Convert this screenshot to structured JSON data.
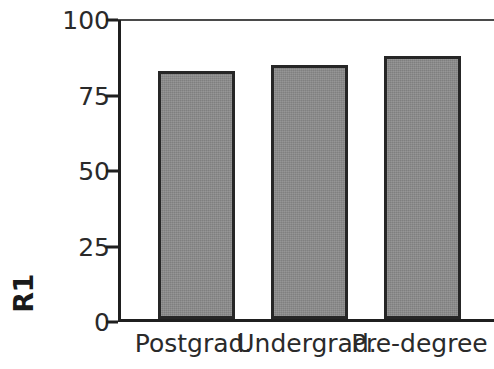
{
  "chart_data": {
    "type": "bar",
    "title": "",
    "subtitle": "",
    "xlabel": "",
    "ylabel": "R1",
    "categories": [
      "Postgrad.",
      "Undergrad.",
      "Pre-degree"
    ],
    "values": [
      82,
      84,
      87
    ],
    "series": [
      {
        "name": "R1",
        "values": [
          82,
          84,
          87
        ]
      }
    ],
    "ylim": [
      0,
      100
    ],
    "yticks": [
      0,
      25,
      50,
      75,
      100
    ],
    "ytick_labels": [
      "0",
      "25",
      "50",
      "75",
      "100"
    ],
    "grid": false,
    "legend": false,
    "legend_position": "none",
    "bar_fill_color": "#8a8a8a",
    "bar_edge_color": "#262626",
    "axis_color": "#1f1f1f",
    "text_color": "#2a2a2a",
    "background_color": "#ffffff"
  },
  "axes": {
    "y_title": "R1",
    "ticks": [
      {
        "label": "100",
        "value": 100
      },
      {
        "label": "75",
        "value": 75
      },
      {
        "label": "50",
        "value": 50
      },
      {
        "label": "25",
        "value": 25
      },
      {
        "label": "0",
        "value": 0
      }
    ]
  },
  "bars": [
    {
      "label": "Postgrad.",
      "value": 82
    },
    {
      "label": "Undergrad.",
      "value": 84
    },
    {
      "label": "Pre-degree",
      "value": 87
    }
  ]
}
